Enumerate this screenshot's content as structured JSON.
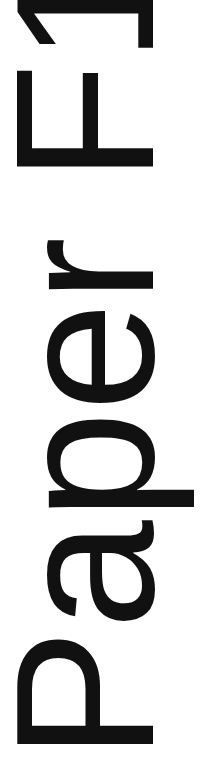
{
  "label": {
    "text": "Paper F1",
    "orientation": "rotated-90-ccw",
    "color": "#111111",
    "background": "#ffffff"
  }
}
